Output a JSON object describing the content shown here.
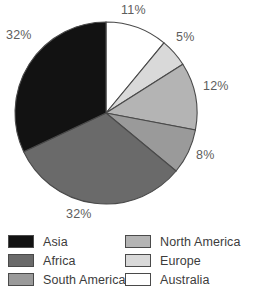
{
  "chart_data": {
    "type": "pie",
    "title": "",
    "categories": [
      "Australia",
      "Europe",
      "North America",
      "South America",
      "Africa",
      "Asia"
    ],
    "values": [
      11,
      5,
      12,
      8,
      32,
      32
    ],
    "unit": "%",
    "start_angle_deg": 0,
    "direction": "clockwise",
    "legend_position": "bottom",
    "grid": false,
    "slices": [
      {
        "label": "Australia",
        "value": 11,
        "display": "11%",
        "color": "#ffffff"
      },
      {
        "label": "Europe",
        "value": 5,
        "display": "5%",
        "color": "#d9d9d9"
      },
      {
        "label": "North America",
        "value": 12,
        "display": "12%",
        "color": "#b4b4b4"
      },
      {
        "label": "South America",
        "value": 8,
        "display": "8%",
        "color": "#9a9a9a"
      },
      {
        "label": "Africa",
        "value": 32,
        "display": "32%",
        "color": "#6a6a6a"
      },
      {
        "label": "Asia",
        "value": 32,
        "display": "32%",
        "color": "#121212"
      }
    ]
  },
  "labels": {
    "australia_pct": "11%",
    "europe_pct": "5%",
    "north_america_pct": "12%",
    "south_america_pct": "8%",
    "africa_pct": "32%",
    "asia_pct": "32%"
  },
  "legend": {
    "column_left": [
      {
        "label": "Asia",
        "color": "#121212"
      },
      {
        "label": "Africa",
        "color": "#6a6a6a"
      },
      {
        "label": "South America",
        "color": "#9a9a9a"
      }
    ],
    "column_right": [
      {
        "label": "North America",
        "color": "#b4b4b4"
      },
      {
        "label": "Europe",
        "color": "#d9d9d9"
      },
      {
        "label": "Australia",
        "color": "#ffffff"
      }
    ]
  },
  "style": {
    "outline_color": "#4a4a4a",
    "label_color": "#5d5d5d",
    "legend_text_color": "#3c3c3c",
    "background": "#ffffff"
  }
}
